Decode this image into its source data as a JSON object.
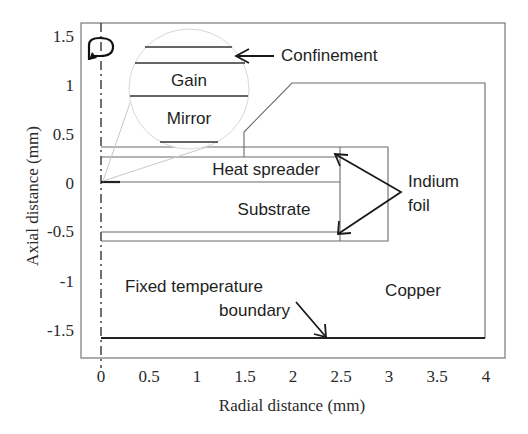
{
  "figure": {
    "x_axis": {
      "label": "Radial distance (mm)",
      "ticks": [
        "0",
        "0.5",
        "1",
        "1.5",
        "2",
        "2.5",
        "3",
        "3.5",
        "4"
      ]
    },
    "y_axis": {
      "label": "Axial distance (mm)",
      "ticks": [
        "1.5",
        "1",
        "0.5",
        "0",
        "-0.5",
        "-1",
        "-1.5"
      ]
    },
    "annotations": {
      "confinement": "Confinement",
      "gain": "Gain",
      "mirror": "Mirror",
      "heat_spreader": "Heat spreader",
      "substrate": "Substrate",
      "indium_line1": "Indium",
      "indium_line2": "foil",
      "copper": "Copper",
      "fixed_line1": "Fixed temperature",
      "fixed_line2": "boundary"
    },
    "icons": {
      "rotation_symbol": "rotation-arrow-icon"
    }
  }
}
